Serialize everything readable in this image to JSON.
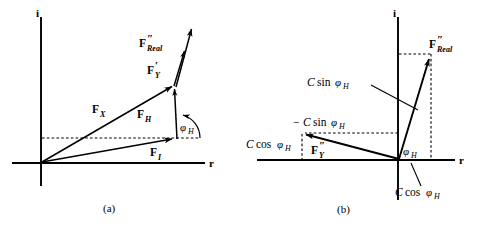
{
  "figure": {
    "panels": [
      {
        "id": "a",
        "caption": "(a)",
        "axes": {
          "imaginary": "i",
          "real": "r"
        },
        "labels": {
          "f_real_base": "F",
          "f_real_prime": "″",
          "f_real_sub": "Real",
          "f_y_base": "F",
          "f_y_prime": "′",
          "f_y_sub": "Y",
          "f_x_base": "F",
          "f_x_sub": "X",
          "f_h_base": "F",
          "f_h_sub": "H",
          "f_i_base": "F",
          "f_i_sub": "I",
          "phi_base": "φ",
          "phi_sub": "H"
        }
      },
      {
        "id": "b",
        "caption": "(b)",
        "axes": {
          "imaginary": "i",
          "real": "r"
        },
        "labels": {
          "f_real_base": "F",
          "f_real_prime": "″",
          "f_real_sub": "Real",
          "f_y_base": "F",
          "f_y_prime": "″",
          "f_y_sub": "Y",
          "c_sin_italic": "C",
          "c_sin_fn": "sin",
          "c_sin_greek": "φ",
          "c_sin_sub": "H",
          "neg_c_sin_minus": "−",
          "neg_c_sin_italic": "C",
          "neg_c_sin_fn": "sin",
          "neg_c_sin_greek": "φ",
          "neg_c_sin_sub": "H",
          "c_cos_left_italic": "C",
          "c_cos_left_fn": "cos",
          "c_cos_left_greek": "φ",
          "c_cos_left_sub": "H",
          "c_cos_bottom_italic": "C",
          "c_cos_bottom_fn": "cos",
          "c_cos_bottom_greek": "φ",
          "c_cos_bottom_sub": "H",
          "phi_base": "φ",
          "phi_sub": "H"
        }
      }
    ],
    "colors": {
      "stroke": "#000000",
      "background": "#ffffff"
    }
  }
}
